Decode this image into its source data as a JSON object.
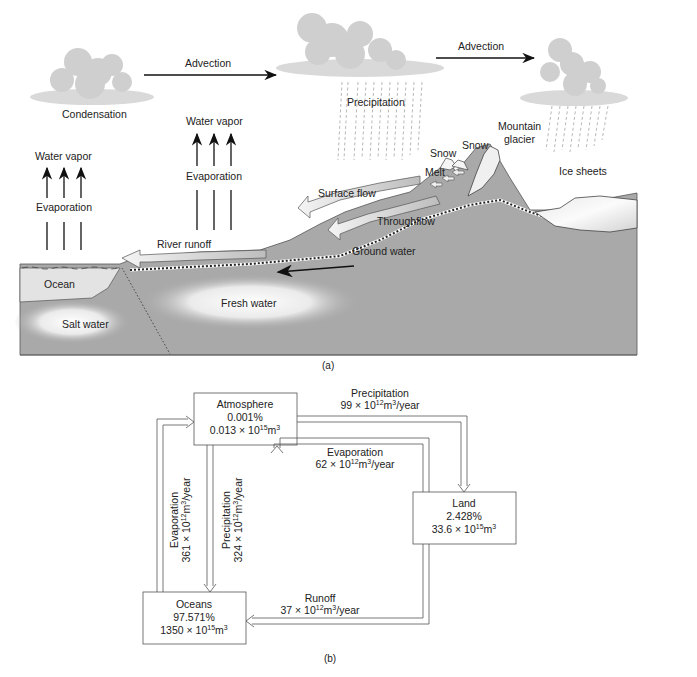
{
  "panel_a": {
    "caption": "(a)",
    "labels": {
      "condensation": "Condensation",
      "advection_1": "Advection",
      "advection_2": "Advection",
      "precipitation": "Precipitation",
      "water_vapor_left": "Water vapor",
      "evaporation_left": "Evaporation",
      "water_vapor_mid": "Water vapor",
      "evaporation_mid": "Evaporation",
      "snow_1": "Snow",
      "snow_2": "Snow",
      "mountain_glacier_1": "Mountain",
      "mountain_glacier_2": "glacier",
      "melt": "Melt",
      "ice_sheets": "Ice sheets",
      "surface_flow": "Surface flow",
      "throughflow": "Throughflow",
      "river_runoff": "River runoff",
      "ground_water": "Ground water",
      "ocean": "Ocean",
      "fresh_water": "Fresh water",
      "salt_water": "Salt water"
    },
    "colors": {
      "land": "#a9a9a9",
      "ocean_surface": "#dcdcdc",
      "cloud": "#cfcfcf",
      "arrow_fill": "#e4e4e4",
      "outline": "#333333"
    }
  },
  "panel_b": {
    "caption": "(b)",
    "boxes": {
      "atmosphere": {
        "name": "Atmosphere",
        "percent": "0.001%",
        "volume_base": "0.013 × 10",
        "volume_exp": "15",
        "volume_unit": "m",
        "volume_unit_exp": "3"
      },
      "land": {
        "name": "Land",
        "percent": "2.428%",
        "volume_base": "33.6 × 10",
        "volume_exp": "15",
        "volume_unit": "m",
        "volume_unit_exp": "3"
      },
      "oceans": {
        "name": "Oceans",
        "percent": "97.571%",
        "volume_base": "1350 × 10",
        "volume_exp": "15",
        "volume_unit": "m",
        "volume_unit_exp": "3"
      }
    },
    "flows": {
      "precip_land": {
        "name": "Precipitation",
        "value": "99 × 10",
        "exp": "12",
        "unit": "m",
        "unit_exp": "3",
        "per": "/year"
      },
      "evap_land": {
        "name": "Evaporation",
        "value": "62 × 10",
        "exp": "12",
        "unit": "m",
        "unit_exp": "3",
        "per": "/year"
      },
      "evap_ocean": {
        "name": "Evaporation",
        "value": "361 × 10",
        "exp": "12",
        "unit": "m",
        "unit_exp": "3",
        "per": "/year"
      },
      "precip_ocean": {
        "name": "Precipitation",
        "value": "324 × 10",
        "exp": "12",
        "unit": "m",
        "unit_exp": "3",
        "per": "/year"
      },
      "runoff": {
        "name": "Runoff",
        "value": "37 × 10",
        "exp": "12",
        "unit": "m",
        "unit_exp": "3",
        "per": "/year"
      }
    }
  }
}
